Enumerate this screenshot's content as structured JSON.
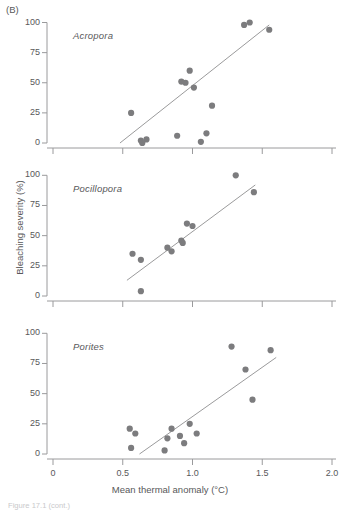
{
  "figure": {
    "part_tag": "(B)",
    "xlabel": "Mean thermal anomaly (°C)",
    "ylabel": "Bleaching severity (%)",
    "caption": "Figure 17.1 (cont.)",
    "marker_color": "#7c7c7e",
    "line_color": "#8e8e90",
    "axis_color": "#9a9a9c",
    "text_color": "#58585a"
  },
  "axes": {
    "x_ticks": [
      "0",
      "0.5",
      "1.0",
      "1.5",
      "2.0"
    ],
    "x_tick_values": [
      0,
      0.5,
      1.0,
      1.5,
      2.0
    ],
    "y_ticks": [
      "0",
      "25",
      "50",
      "75",
      "100"
    ],
    "y_tick_values": [
      0,
      25,
      50,
      75,
      100
    ],
    "xlim": [
      0,
      2.0
    ],
    "ylim": [
      0,
      100
    ]
  },
  "chart_data": {
    "type": "scatter",
    "title": "",
    "xlabel": "Mean thermal anomaly (°C)",
    "ylabel": "Bleaching severity (%)",
    "xlim": [
      0,
      2.0
    ],
    "ylim": [
      0,
      100
    ],
    "grid": false,
    "legend": "none",
    "panels": [
      {
        "label": "Acropora",
        "points": [
          {
            "x": 0.56,
            "y": 25
          },
          {
            "x": 0.98,
            "y": 60
          },
          {
            "x": 0.92,
            "y": 51
          },
          {
            "x": 0.95,
            "y": 50
          },
          {
            "x": 1.01,
            "y": 46
          },
          {
            "x": 1.14,
            "y": 31
          },
          {
            "x": 0.89,
            "y": 6
          },
          {
            "x": 1.1,
            "y": 8
          },
          {
            "x": 1.06,
            "y": 1
          },
          {
            "x": 0.63,
            "y": 2
          },
          {
            "x": 0.67,
            "y": 3
          },
          {
            "x": 0.64,
            "y": 0
          },
          {
            "x": 1.37,
            "y": 98
          },
          {
            "x": 1.41,
            "y": 100
          },
          {
            "x": 1.55,
            "y": 94
          }
        ],
        "trend_line": {
          "x1": 0.48,
          "y1": 0,
          "x2": 1.55,
          "y2": 98
        }
      },
      {
        "label": "Pocillopora",
        "points": [
          {
            "x": 0.57,
            "y": 35
          },
          {
            "x": 0.63,
            "y": 30
          },
          {
            "x": 0.63,
            "y": 4
          },
          {
            "x": 0.82,
            "y": 40
          },
          {
            "x": 0.85,
            "y": 37
          },
          {
            "x": 0.92,
            "y": 46
          },
          {
            "x": 0.93,
            "y": 44
          },
          {
            "x": 0.96,
            "y": 60
          },
          {
            "x": 1.0,
            "y": 58
          },
          {
            "x": 1.31,
            "y": 100
          },
          {
            "x": 1.44,
            "y": 86
          }
        ],
        "trend_line": {
          "x1": 0.53,
          "y1": 13,
          "x2": 1.45,
          "y2": 92
        }
      },
      {
        "label": "Porites",
        "points": [
          {
            "x": 0.55,
            "y": 21
          },
          {
            "x": 0.59,
            "y": 17
          },
          {
            "x": 0.56,
            "y": 5
          },
          {
            "x": 0.8,
            "y": 3
          },
          {
            "x": 0.82,
            "y": 13
          },
          {
            "x": 0.85,
            "y": 21
          },
          {
            "x": 0.91,
            "y": 15
          },
          {
            "x": 0.94,
            "y": 9
          },
          {
            "x": 0.98,
            "y": 25
          },
          {
            "x": 1.03,
            "y": 17
          },
          {
            "x": 1.28,
            "y": 89
          },
          {
            "x": 1.38,
            "y": 70
          },
          {
            "x": 1.43,
            "y": 45
          },
          {
            "x": 1.56,
            "y": 86
          }
        ],
        "trend_line": {
          "x1": 0.62,
          "y1": 0,
          "x2": 1.6,
          "y2": 80
        }
      }
    ]
  }
}
